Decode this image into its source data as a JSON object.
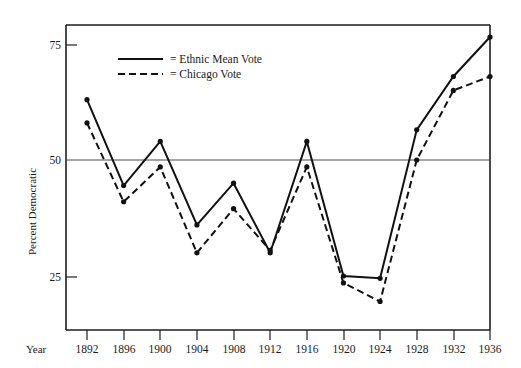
{
  "chart_data": {
    "type": "line",
    "title": "",
    "xlabel": "Year",
    "ylabel": "Percent Democratic",
    "x": [
      1892,
      1896,
      1900,
      1904,
      1908,
      1912,
      1916,
      1920,
      1924,
      1928,
      1932,
      1936
    ],
    "xtick_labels": [
      "1892",
      "1896",
      "1900",
      "1904",
      "1908",
      "1912",
      "1916",
      "1920",
      "1924",
      "1928",
      "1932",
      "1936"
    ],
    "ytick_values": [
      25,
      50,
      75
    ],
    "ytick_labels": [
      "25",
      "50",
      "75"
    ],
    "xlim": [
      1890,
      1938
    ],
    "ylim": [
      15,
      82
    ],
    "grid": "horizontal-line-at-50-only",
    "legend_position": "upper-left-inside",
    "series": [
      {
        "name": "= Ethnic Mean Vote",
        "style": "solid",
        "color": "#111111",
        "values": [
          63,
          44.5,
          54,
          36,
          45,
          30,
          54,
          25,
          24.5,
          56.5,
          68,
          76.5
        ]
      },
      {
        "name": "= Chicago Vote",
        "style": "dashed",
        "color": "#111111",
        "values": [
          58,
          41,
          48.5,
          30,
          39.5,
          30.5,
          48.5,
          23.5,
          19.5,
          50,
          65,
          68
        ]
      }
    ],
    "annotations": []
  },
  "axes": {
    "x_axis_caption": "Year",
    "y_axis_caption": "Percent Democratic"
  },
  "legend": {
    "entries": [
      {
        "label": "= Ethnic Mean Vote",
        "style": "solid"
      },
      {
        "label": "= Chicago Vote",
        "style": "dashed"
      }
    ]
  },
  "ticks": {
    "y": [
      "75",
      "50",
      "25"
    ],
    "x": [
      "1892",
      "1896",
      "1900",
      "1904",
      "1908",
      "1912",
      "1916",
      "1920",
      "1924",
      "1928",
      "1932",
      "1936"
    ]
  },
  "colors": {
    "ink": "#111111",
    "gridline": "#4a4a4a",
    "background": "#ffffff"
  }
}
